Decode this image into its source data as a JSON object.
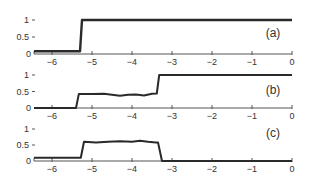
{
  "chart_data": [
    {
      "type": "line",
      "panel_label": "(a)",
      "title": "",
      "xlabel": "",
      "ylabel": "",
      "xlim": [
        -6.45,
        0
      ],
      "ylim": [
        0,
        1
      ],
      "x_ticks": [
        "-6",
        "-5",
        "-4",
        "-3",
        "-2",
        "-1",
        "0"
      ],
      "y_ticks": [
        "0",
        "0.5",
        "1"
      ],
      "grid": false,
      "series": [
        {
          "name": "a",
          "x": [
            -6.45,
            -5.3,
            -5.25,
            0
          ],
          "values": [
            0.08,
            0.08,
            1.0,
            1.0
          ]
        }
      ]
    },
    {
      "type": "line",
      "panel_label": "(b)",
      "title": "",
      "xlabel": "",
      "ylabel": "",
      "xlim": [
        -6.45,
        0
      ],
      "ylim": [
        0,
        1
      ],
      "x_ticks": [
        "-6",
        "-5",
        "-4",
        "-3",
        "-2",
        "-1",
        "0"
      ],
      "y_ticks": [
        "0",
        "0.5",
        "1"
      ],
      "grid": false,
      "series": [
        {
          "name": "b",
          "x": [
            -6.45,
            -5.4,
            -5.33,
            -5.0,
            -4.7,
            -4.5,
            -4.3,
            -4.1,
            -3.9,
            -3.7,
            -3.5,
            -3.38,
            -3.32,
            0
          ],
          "values": [
            0.0,
            0.0,
            0.42,
            0.42,
            0.43,
            0.4,
            0.37,
            0.4,
            0.41,
            0.38,
            0.43,
            0.44,
            1.0,
            1.0
          ]
        }
      ]
    },
    {
      "type": "line",
      "panel_label": "(c)",
      "title": "",
      "xlabel": "",
      "ylabel": "",
      "xlim": [
        -6.45,
        0
      ],
      "ylim": [
        0,
        1
      ],
      "x_ticks": [
        "-6",
        "-5",
        "-4",
        "-3",
        "-2",
        "-1",
        "0"
      ],
      "y_ticks": [
        "0",
        "0.5",
        "1"
      ],
      "grid": false,
      "series": [
        {
          "name": "c",
          "x": [
            -6.45,
            -5.28,
            -5.2,
            -4.9,
            -4.6,
            -4.3,
            -4.0,
            -3.8,
            -3.6,
            -3.4,
            -3.35,
            -3.25,
            0
          ],
          "values": [
            0.1,
            0.1,
            0.6,
            0.58,
            0.6,
            0.62,
            0.6,
            0.63,
            0.6,
            0.58,
            0.58,
            0.0,
            0.0
          ]
        }
      ]
    }
  ]
}
